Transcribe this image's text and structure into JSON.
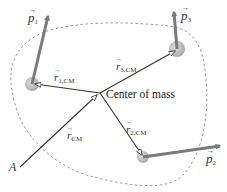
{
  "diagram": {
    "type": "center-of-mass vector diagram",
    "colors": {
      "boundary": "#9a9a9a",
      "momentum_arrow": "#7a7a7a",
      "position_arrow": "#333333",
      "particle": "#b5b5b5"
    },
    "labels": {
      "p1": "p",
      "p1_sub": "1",
      "p2": "p",
      "p2_sub": "2",
      "p3": "p",
      "p3_sub": "3",
      "r1cm": "r",
      "r1cm_sub": "1,CM",
      "r2cm": "r",
      "r2cm_sub": "2,CM",
      "r3cm": "r",
      "r3cm_sub": "3,CM",
      "rcm": "r",
      "rcm_sub": "CM",
      "center_of_mass": "Center of mass",
      "origin": "A"
    },
    "nodes": [
      {
        "id": "particle-1",
        "x": 32,
        "y": 84
      },
      {
        "id": "particle-2",
        "x": 143,
        "y": 157
      },
      {
        "id": "particle-3",
        "x": 177,
        "y": 49
      },
      {
        "id": "center-of-mass",
        "x": 100,
        "y": 93
      },
      {
        "id": "origin-A",
        "x": 20,
        "y": 167
      }
    ]
  }
}
